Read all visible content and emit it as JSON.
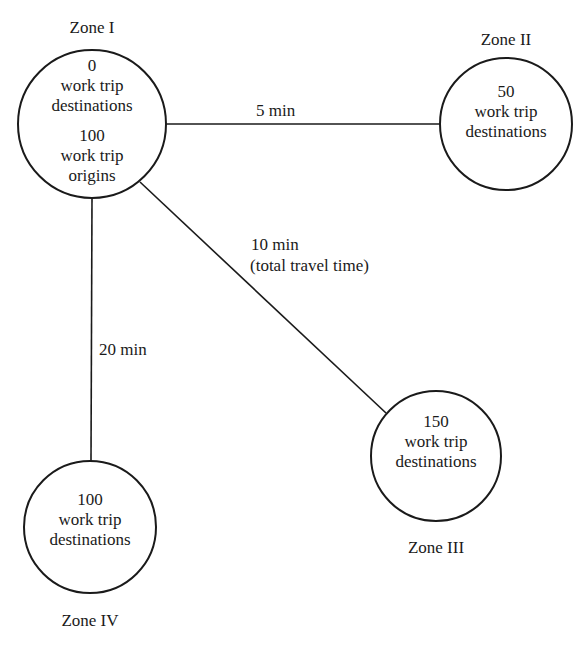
{
  "diagram": {
    "zones": [
      {
        "id": "zone-1",
        "name": "Zone I",
        "lines": [
          "0",
          "work trip",
          "destinations",
          "100",
          "work trip",
          "origins"
        ]
      },
      {
        "id": "zone-2",
        "name": "Zone II",
        "lines": [
          "50",
          "work trip",
          "destinations"
        ]
      },
      {
        "id": "zone-3",
        "name": "Zone III",
        "lines": [
          "150",
          "work trip",
          "destinations"
        ]
      },
      {
        "id": "zone-4",
        "name": "Zone IV",
        "lines": [
          "100",
          "work trip",
          "destinations"
        ]
      }
    ],
    "links": [
      {
        "from": "Zone I",
        "to": "Zone II",
        "label": "5 min"
      },
      {
        "from": "Zone I",
        "to": "Zone III",
        "label": "10 min",
        "sublabel": "(total travel time)"
      },
      {
        "from": "Zone I",
        "to": "Zone IV",
        "label": "20 min"
      }
    ],
    "colors": {
      "stroke": "#1a1a1a",
      "background": "#ffffff"
    }
  }
}
